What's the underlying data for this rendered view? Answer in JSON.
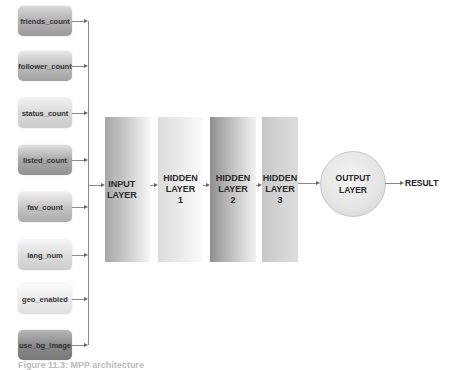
{
  "diagram": {
    "type": "neural-network-architecture",
    "inputs": [
      {
        "label": "friends_count",
        "top": 6,
        "shade": "dark"
      },
      {
        "label": "follower_count",
        "top": 51,
        "shade": "dark"
      },
      {
        "label": "status_count",
        "top": 98,
        "shade": "light"
      },
      {
        "label": "listed_count",
        "top": 145,
        "shade": "dark"
      },
      {
        "label": "fav_count",
        "top": 192,
        "shade": "mid"
      },
      {
        "label": "lang_num",
        "top": 240,
        "shade": "light"
      },
      {
        "label": "geo_enabled",
        "top": 284,
        "shade": "lighter"
      },
      {
        "label": "use_bg_image",
        "top": 330,
        "shade": "darkest"
      }
    ],
    "layers": [
      {
        "line1": "INPUT",
        "line2": "LAYER",
        "line3": ""
      },
      {
        "line1": "HIDDEN",
        "line2": "LAYER",
        "line3": "1"
      },
      {
        "line1": "HIDDEN",
        "line2": "LAYER",
        "line3": "2"
      },
      {
        "line1": "HIDDEN",
        "line2": "LAYER",
        "line3": "3"
      }
    ],
    "output": {
      "line1": "OUTPUT",
      "line2": "LAYER"
    },
    "result_label": "RESULT",
    "caption": "Figure 11.3: MPP architecture"
  },
  "colors": {
    "dark": "#9a9a9a",
    "mid": "#aaaaaa",
    "light": "#cfcfcf",
    "lighter": "#e2e2e2",
    "darkest": "#7d7d7d",
    "connector": "#8a8a8a"
  }
}
